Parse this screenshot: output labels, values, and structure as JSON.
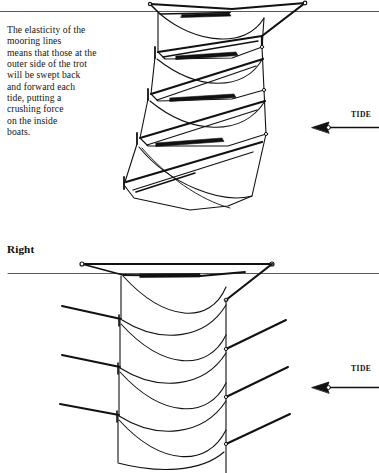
{
  "figure": {
    "background_color": "#ffffff",
    "ink_color": "#111111",
    "waterline_color": "#555555"
  },
  "panels": [
    {
      "id": "panel-top",
      "label": "",
      "caption_lines": [
        "The elasticity of the",
        "mooring lines",
        "means that those at the",
        "outer side of the trot",
        "will be swept back",
        "and forward each",
        "tide, putting a",
        "crushing force",
        "on the inside",
        "boats."
      ],
      "tide": {
        "label": "TIDE",
        "direction": "left"
      },
      "waterline_y": 11,
      "boat_count": 4
    },
    {
      "id": "panel-bottom",
      "label": "Right",
      "caption_lines": [],
      "tide": {
        "label": "TIDE",
        "direction": "left"
      },
      "waterline_y": 273,
      "boat_count": 4
    }
  ],
  "icons": {
    "tide_arrow": "arrow-left-icon"
  }
}
